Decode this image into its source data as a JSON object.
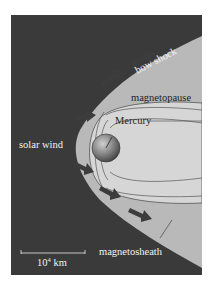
{
  "diagram": {
    "labels": {
      "bow_shock": "bow shock",
      "magnetopause": "magnetopause",
      "mercury": "Mercury",
      "solar_wind": "solar wind",
      "magnetosheath": "magnetosheath",
      "scale_base": "10",
      "scale_exp": "4",
      "scale_unit": " km"
    },
    "colors": {
      "background": "#3a3a3a",
      "sheath": "#b9b9b9",
      "magnetosphere": "#d8d8d8",
      "arrow": "#3c3c3c",
      "text_light": "#f2f2f2",
      "text_dark": "#1e1e1e"
    }
  }
}
